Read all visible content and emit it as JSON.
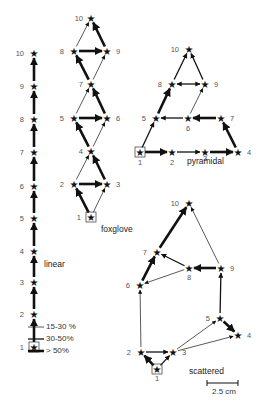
{
  "figure": {
    "panels": [
      {
        "id": "linear",
        "title": "linear",
        "nodes": [
          {
            "n": "1",
            "x": 34,
            "y": 347,
            "start": true
          },
          {
            "n": "2",
            "x": 34,
            "y": 314
          },
          {
            "n": "3",
            "x": 34,
            "y": 282
          },
          {
            "n": "4",
            "x": 34,
            "y": 251
          },
          {
            "n": "5",
            "x": 34,
            "y": 218
          },
          {
            "n": "6",
            "x": 34,
            "y": 186
          },
          {
            "n": "7",
            "x": 34,
            "y": 152
          },
          {
            "n": "8",
            "x": 34,
            "y": 119
          },
          {
            "n": "9",
            "x": 34,
            "y": 86
          },
          {
            "n": "10",
            "x": 34,
            "y": 53
          }
        ],
        "edges": [
          {
            "from": "1",
            "to": "2",
            "w": 3
          },
          {
            "from": "2",
            "to": "3",
            "w": 3
          },
          {
            "from": "3",
            "to": "4",
            "w": 3
          },
          {
            "from": "4",
            "to": "5",
            "w": 3
          },
          {
            "from": "5",
            "to": "6",
            "w": 3
          },
          {
            "from": "6",
            "to": "7",
            "w": 3
          },
          {
            "from": "7",
            "to": "8",
            "w": 3
          },
          {
            "from": "8",
            "to": "9",
            "w": 3
          },
          {
            "from": "9",
            "to": "10",
            "w": 3
          }
        ]
      },
      {
        "id": "foxglove",
        "title": "foxglove",
        "nodes": [
          {
            "n": "1",
            "x": 90,
            "y": 216,
            "start": true
          },
          {
            "n": "2",
            "x": 74,
            "y": 184
          },
          {
            "n": "3",
            "x": 107,
            "y": 184
          },
          {
            "n": "4",
            "x": 90,
            "y": 151
          },
          {
            "n": "5",
            "x": 74,
            "y": 118
          },
          {
            "n": "6",
            "x": 107,
            "y": 118
          },
          {
            "n": "7",
            "x": 90,
            "y": 84
          },
          {
            "n": "8",
            "x": 74,
            "y": 50
          },
          {
            "n": "9",
            "x": 107,
            "y": 50
          },
          {
            "n": "10",
            "x": 90,
            "y": 17
          }
        ],
        "edges": [
          {
            "from": "1",
            "to": "2",
            "w": 3
          },
          {
            "from": "1",
            "to": "3",
            "w": 1
          },
          {
            "from": "2",
            "to": "3",
            "w": 3
          },
          {
            "from": "3",
            "to": "4",
            "w": 3
          },
          {
            "from": "2",
            "to": "4",
            "w": 1
          },
          {
            "from": "4",
            "to": "5",
            "w": 3
          },
          {
            "from": "4",
            "to": "6",
            "w": 1
          },
          {
            "from": "5",
            "to": "6",
            "w": 3
          },
          {
            "from": "6",
            "to": "7",
            "w": 3
          },
          {
            "from": "5",
            "to": "7",
            "w": 1
          },
          {
            "from": "7",
            "to": "8",
            "w": 3
          },
          {
            "from": "7",
            "to": "9",
            "w": 1
          },
          {
            "from": "8",
            "to": "9",
            "w": 3
          },
          {
            "from": "9",
            "to": "10",
            "w": 3
          },
          {
            "from": "8",
            "to": "10",
            "w": 1
          }
        ]
      },
      {
        "id": "pyramidal",
        "title": "pyramidal",
        "nodes": [
          {
            "n": "1",
            "x": 170,
            "y": 151,
            "start": true
          },
          {
            "n": "2",
            "x": 172,
            "y": 150
          },
          {
            "n": "3",
            "x": 205,
            "y": 150
          },
          {
            "n": "4",
            "x": 238,
            "y": 150
          },
          {
            "n": "5",
            "x": 176,
            "y": 117
          },
          {
            "n": "6",
            "x": 210,
            "y": 117
          },
          {
            "n": "7",
            "x": 221,
            "y": 117
          },
          {
            "n": "8",
            "x": 173,
            "y": 83
          },
          {
            "n": "9",
            "x": 205,
            "y": 83
          },
          {
            "n": "10",
            "x": 189,
            "y": 49
          }
        ],
        "edges": [
          {
            "from": "1",
            "to": "2",
            "w": 3
          },
          {
            "from": "1",
            "to": "5",
            "w": 2
          },
          {
            "from": "2",
            "to": "3",
            "w": 2
          },
          {
            "from": "3",
            "to": "4",
            "w": 3
          },
          {
            "from": "4",
            "to": "7",
            "w": 3
          },
          {
            "from": "7",
            "to": "6",
            "w": 3
          },
          {
            "from": "6",
            "to": "5",
            "w": 2
          },
          {
            "from": "5",
            "to": "8",
            "w": 3
          },
          {
            "from": "6",
            "to": "9",
            "w": 1
          },
          {
            "from": "8",
            "to": "9",
            "w": 2,
            "bidirectional": true
          },
          {
            "from": "8",
            "to": "10",
            "w": 2
          },
          {
            "from": "9",
            "to": "10",
            "w": 2
          }
        ]
      },
      {
        "id": "scattered",
        "title": "scattered",
        "nodes": [
          {
            "n": "1",
            "x": 155,
            "y": 369,
            "start": true
          },
          {
            "n": "2",
            "x": 141,
            "y": 351
          },
          {
            "n": "3",
            "x": 173,
            "y": 351
          },
          {
            "n": "4",
            "x": 238,
            "y": 335
          },
          {
            "n": "5",
            "x": 220,
            "y": 318
          },
          {
            "n": "6",
            "x": 140,
            "y": 284
          },
          {
            "n": "7",
            "x": 157,
            "y": 251
          },
          {
            "n": "8",
            "x": 189,
            "y": 268
          },
          {
            "n": "9",
            "x": 221,
            "y": 268
          },
          {
            "n": "10",
            "x": 189,
            "y": 202
          }
        ],
        "edges": [
          {
            "from": "1",
            "to": "2",
            "w": 3
          },
          {
            "from": "1",
            "to": "3",
            "w": 2
          },
          {
            "from": "2",
            "to": "3",
            "w": 2
          },
          {
            "from": "2",
            "to": "6",
            "w": 1
          },
          {
            "from": "3",
            "to": "5",
            "w": 1
          },
          {
            "from": "3",
            "to": "4",
            "w": 1
          },
          {
            "from": "5",
            "to": "4",
            "w": 3
          },
          {
            "from": "5",
            "to": "9",
            "w": 2
          },
          {
            "from": "9",
            "to": "8",
            "w": 3
          },
          {
            "from": "8",
            "to": "7",
            "w": 2
          },
          {
            "from": "8",
            "to": "6",
            "w": 1
          },
          {
            "from": "6",
            "to": "7",
            "w": 3
          },
          {
            "from": "7",
            "to": "10",
            "w": 3
          },
          {
            "from": "9",
            "to": "10",
            "w": 1
          }
        ]
      }
    ],
    "legend": {
      "items": [
        {
          "label": "15-30 %",
          "w": 1
        },
        {
          "label": "30-50%",
          "w": 2
        },
        {
          "label": "> 50%",
          "w": 3
        }
      ]
    },
    "scale_bar": {
      "label": "2.5 cm"
    }
  }
}
